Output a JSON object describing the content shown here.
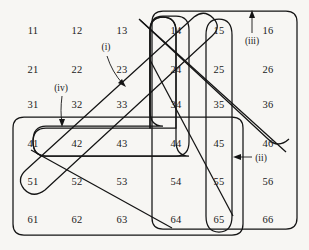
{
  "figure": {
    "type": "diagram",
    "background_color": "#f7f6f3",
    "ink_color": "#141414"
  },
  "grid": {
    "rows": 6,
    "cols": 6,
    "col_x": [
      33,
      77,
      122,
      176,
      219,
      268
    ],
    "row_y": [
      30,
      69,
      104,
      143,
      181,
      219
    ],
    "cells": [
      [
        "11",
        "12",
        "13",
        "14",
        "15",
        "16"
      ],
      [
        "21",
        "22",
        "23",
        "24",
        "25",
        "26"
      ],
      [
        "31",
        "32",
        "33",
        "34",
        "35",
        "36"
      ],
      [
        "41",
        "42",
        "43",
        "44",
        "45",
        "46"
      ],
      [
        "51",
        "52",
        "53",
        "54",
        "55",
        "56"
      ],
      [
        "61",
        "62",
        "63",
        "64",
        "65",
        "66"
      ]
    ]
  },
  "callouts": [
    {
      "id": "i",
      "label": "(i)",
      "x": 106,
      "y": 47,
      "points_to": "upper diagonal band edge near cell 33"
    },
    {
      "id": "ii",
      "label": "(ii)",
      "x": 261,
      "y": 158,
      "points_to": "right edge of vertical loop through 15-65"
    },
    {
      "id": "iii",
      "label": "(iii)",
      "x": 252,
      "y": 41,
      "points_to": "top edge of outer rounded rectangle"
    },
    {
      "id": "iv",
      "label": "(iv)",
      "x": 61,
      "y": 88,
      "points_to": "top edge of L-shaped loop near cell 42"
    }
  ],
  "loops": [
    {
      "name": "outer-rounded-rect-right",
      "contains": [
        "14",
        "15",
        "16",
        "24",
        "25",
        "26",
        "34",
        "35",
        "36",
        "44",
        "45",
        "46",
        "54",
        "55",
        "56",
        "64",
        "65",
        "66"
      ]
    },
    {
      "name": "vertical-pill-14-34",
      "contains": [
        "14",
        "24",
        "34"
      ]
    },
    {
      "name": "vertical-pill-15-65",
      "contains": [
        "15",
        "25",
        "35",
        "45",
        "55",
        "65"
      ]
    },
    {
      "name": "L-shaped-loop-iv",
      "contains": [
        "14",
        "24",
        "34",
        "44",
        "43",
        "42",
        "41"
      ]
    },
    {
      "name": "outer-rounded-rect-left-bottom",
      "contains": [
        "41",
        "51",
        "61",
        "42",
        "52",
        "62",
        "43",
        "53",
        "63",
        "64"
      ]
    },
    {
      "name": "diagonal-band-i",
      "contains": [
        "51",
        "42",
        "33",
        "24",
        "15"
      ]
    },
    {
      "name": "diagonal-band-descending",
      "contains": [
        "14",
        "25",
        "36",
        "46"
      ]
    }
  ]
}
